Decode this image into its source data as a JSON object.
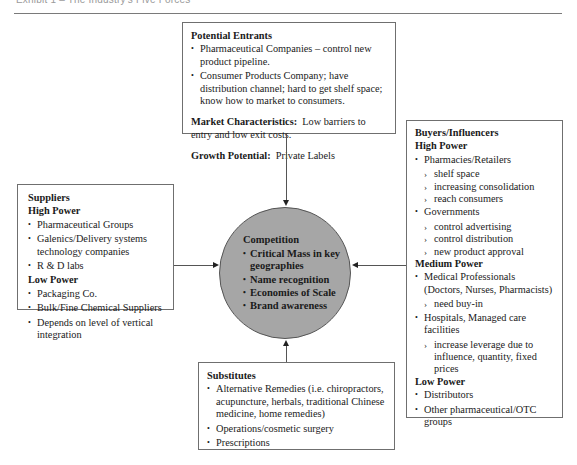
{
  "header": {
    "title": "Exhibit 1 – The Industry's Five Forces"
  },
  "entrants": {
    "title": "Potential Entrants",
    "items": [
      "Pharmaceutical Companies – control new product pipeline.",
      "Consumer Products Company; have distribution channel; hard to get shelf space; know how to market to consumers."
    ],
    "market_label": "Market Characteristics:",
    "market_text": "Low barriers to entry and low exit costs.",
    "growth_label": "Growth Potential:",
    "growth_text": "Private Labels"
  },
  "suppliers": {
    "title": "Suppliers",
    "high_label": "High Power",
    "high_items": [
      "Pharmaceutical Groups",
      "Galenics/Delivery systems technology companies",
      "R & D labs"
    ],
    "low_label": "Low Power",
    "low_items": [
      "Packaging Co.",
      "Bulk/Fine Chemical Suppliers",
      "Depends on level of vertical integration"
    ]
  },
  "competition": {
    "title": "Competition",
    "items": [
      "Critical Mass in key geographies",
      "Name recognition",
      "Economies of Scale",
      "Brand awareness"
    ]
  },
  "buyers": {
    "title": "Buyers/Influencers",
    "high_label": "High Power",
    "high_groups": [
      {
        "label": "Pharmacies/Retailers",
        "subs": [
          "shelf space",
          "increasing consolidation",
          "reach consumers"
        ]
      },
      {
        "label": "Governments",
        "subs": [
          "control advertising",
          "control distribution",
          "new product approval"
        ]
      }
    ],
    "medium_label": "Medium Power",
    "medium_groups": [
      {
        "label": "Medical Professionals (Doctors, Nurses, Pharmacists)",
        "subs": [
          "need buy-in"
        ]
      },
      {
        "label": "Hospitals, Managed care facilities",
        "subs": [
          "increase leverage due to influence, quantity, fixed prices"
        ]
      }
    ],
    "low_label": "Low Power",
    "low_items": [
      "Distributors",
      "Other pharmaceutical/OTC groups"
    ]
  },
  "substitutes": {
    "title": "Substitutes",
    "items": [
      "Alternative Remedies (i.e. chiropractors, acupuncture, herbals, traditional Chinese medicine, home remedies)",
      "Operations/cosmetic surgery",
      "Prescriptions"
    ]
  }
}
